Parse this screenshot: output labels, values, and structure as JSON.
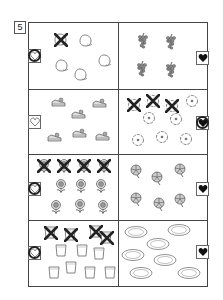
{
  "worksheet": {
    "number": "5",
    "rows": [
      {
        "left": {
          "item": "peach",
          "total": 5,
          "crossed": 1,
          "heart": "outline",
          "heart_circled": true
        },
        "right": {
          "item": "grapes",
          "total": 4,
          "crossed": 0,
          "heart": "filled",
          "heart_circled": false
        }
      },
      {
        "left": {
          "item": "cake-slice",
          "total": 6,
          "crossed": 0,
          "heart": "outline",
          "heart_circled": false
        },
        "right": {
          "item": "flower",
          "total": 8,
          "crossed": 3,
          "heart": "filled",
          "heart_circled": true
        }
      },
      {
        "left": {
          "item": "sunflower",
          "total": 10,
          "crossed": 4,
          "heart": "outline",
          "heart_circled": true
        },
        "right": {
          "item": "pinwheel-flower",
          "total": 6,
          "crossed": 0,
          "heart": "filled",
          "heart_circled": false
        }
      },
      {
        "left": {
          "item": "glass",
          "total": 11,
          "crossed": 4,
          "heart": "outline",
          "heart_circled": true
        },
        "right": {
          "item": "plate",
          "total": 7,
          "crossed": 0,
          "heart": "filled",
          "heart_circled": false
        }
      }
    ]
  }
}
